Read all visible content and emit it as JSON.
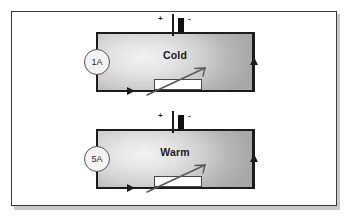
{
  "figure": {
    "background": "#ffffff",
    "border_color": "#3a3a3c"
  },
  "circuits": [
    {
      "id": "cold-circuit",
      "ammeter_reading": "1A",
      "temperature_label": "Cold",
      "battery": {
        "positive": "+",
        "negative": "-"
      },
      "component": "thermistor",
      "current_arrow_bottom": "right",
      "current_arrow_right": "up"
    },
    {
      "id": "warm-circuit",
      "ammeter_reading": "5A",
      "temperature_label": "Warm",
      "battery": {
        "positive": "+",
        "negative": "-"
      },
      "component": "thermistor",
      "current_arrow_bottom": "right",
      "current_arrow_right": "up"
    }
  ],
  "colors": {
    "wire": "#1c1c1c",
    "panel_border": "#3a3a3c",
    "fill_light": "#f2f2f2",
    "fill_dark": "#a8a8a8",
    "resistor_fill": "#ffffff"
  }
}
